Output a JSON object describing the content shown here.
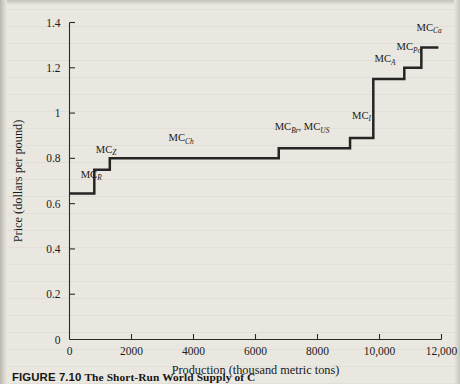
{
  "figure": {
    "caption_label": "FIGURE 7.10",
    "caption_text": "The Short-Run World Supply of C"
  },
  "chart_data": {
    "type": "line",
    "subtype": "step",
    "title": "",
    "xlabel": "Production (thousand metric tons)",
    "ylabel": "Price (dollars per pound)",
    "xlim": [
      0,
      12000
    ],
    "ylim": [
      0,
      1.4
    ],
    "grid": false,
    "legend": "inline-annotations",
    "xticks": [
      0,
      2000,
      4000,
      6000,
      8000,
      10000,
      12000
    ],
    "xticklabels": [
      "0",
      "2000",
      "4000",
      "6000",
      "8000",
      "10,000",
      "12,000"
    ],
    "yticks": [
      0,
      0.2,
      0.4,
      0.6,
      0.8,
      1,
      1.2,
      1.4
    ],
    "yticklabels": [
      "0",
      "0.2",
      "0.4",
      "0.6",
      "0.8",
      "1",
      "1.2",
      "1.4"
    ],
    "steps": [
      {
        "label": "MC",
        "sub": "R",
        "label_full": "MC_R",
        "x_start": 0,
        "x_end": 800,
        "price": 0.645
      },
      {
        "label": "MC",
        "sub": "Z",
        "label_full": "MC_Z",
        "x_start": 800,
        "x_end": 1300,
        "price": 0.75
      },
      {
        "label": "MC",
        "sub": "Ch",
        "label_full": "MC_Ch",
        "x_start": 1300,
        "x_end": 6750,
        "price": 0.8
      },
      {
        "label": "MC",
        "sub": "Br, MC_US",
        "label_full": "MC_Br, MC_US",
        "x_start": 6750,
        "x_end": 9050,
        "price": 0.845
      },
      {
        "label": "MC",
        "sub": "I",
        "label_full": "MC_I",
        "x_start": 9050,
        "x_end": 9800,
        "price": 0.89
      },
      {
        "label": "MC",
        "sub": "A",
        "label_full": "MC_A",
        "x_start": 9800,
        "x_end": 10800,
        "price": 1.15
      },
      {
        "label": "MC",
        "sub": "Po",
        "label_full": "MC_Po",
        "x_start": 10800,
        "x_end": 11350,
        "price": 1.2
      },
      {
        "label": "MC",
        "sub": "Ca",
        "label_full": "MC_Ca",
        "x_start": 11350,
        "x_end": 11900,
        "price": 1.29
      }
    ],
    "annotations": [
      {
        "text": "MC",
        "sub": "R",
        "x": 700,
        "y": 0.715,
        "anchor": "middle"
      },
      {
        "text": "MC",
        "sub": "Z",
        "x": 1180,
        "y": 0.825,
        "anchor": "middle"
      },
      {
        "text": "MC",
        "sub": "Ch",
        "x": 3600,
        "y": 0.875,
        "anchor": "middle"
      },
      {
        "text": "MC",
        "sub": "Br",
        "x": 7500,
        "y": 0.925,
        "anchor": "middle",
        "text2": "MC",
        "sub2": "US"
      },
      {
        "text": "MC",
        "sub": "I",
        "x": 9420,
        "y": 0.975,
        "anchor": "middle"
      },
      {
        "text": "MC",
        "sub": "A",
        "x": 10180,
        "y": 1.225,
        "anchor": "middle"
      },
      {
        "text": "MC",
        "sub": "Po",
        "x": 10950,
        "y": 1.278,
        "anchor": "middle"
      },
      {
        "text": "MC",
        "sub": "Ca",
        "x": 11600,
        "y": 1.363,
        "anchor": "middle"
      }
    ]
  },
  "colors": {
    "page_background": "#e9e7e0",
    "ink": "#1a1917",
    "curve": "#262523",
    "axis": "#2b2a27"
  }
}
